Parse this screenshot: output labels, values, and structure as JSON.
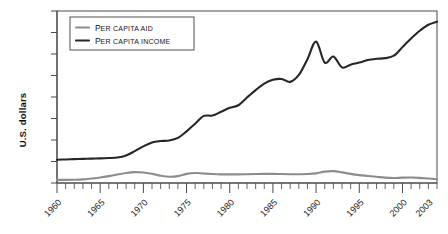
{
  "chart_data": {
    "type": "line",
    "title": "",
    "xlabel": "",
    "ylabel": "U.S. dollars",
    "grid": false,
    "legend_position": "top-left",
    "x_axis": {
      "start": 1960,
      "end": 2004,
      "minor_tick_interval": 1,
      "major_tick_interval": 5,
      "tick_labels": [
        "1960",
        "1965",
        "1970",
        "1975",
        "1980",
        "1985",
        "1990",
        "1995",
        "2000",
        "2003"
      ],
      "tick_label_years": [
        1960,
        1965,
        1970,
        1975,
        1980,
        1985,
        1990,
        1995,
        2000,
        2003
      ],
      "tick_label_rotation_degrees": -45
    },
    "y_axis": {
      "labels_shown": false,
      "tick_count": 8,
      "ylim_relative": [
        0,
        1
      ]
    },
    "x": [
      1960,
      1961,
      1962,
      1963,
      1964,
      1965,
      1966,
      1967,
      1968,
      1969,
      1970,
      1971,
      1972,
      1973,
      1974,
      1975,
      1976,
      1977,
      1978,
      1979,
      1980,
      1981,
      1982,
      1983,
      1984,
      1985,
      1986,
      1987,
      1988,
      1989,
      1990,
      1991,
      1992,
      1993,
      1994,
      1995,
      1996,
      1997,
      1998,
      1999,
      2000,
      2001,
      2002,
      2003,
      2004
    ],
    "series": [
      {
        "name": "Per capita income",
        "legend_lead": "P",
        "legend_rest": "ER CAPITA INCOME",
        "color": "#262626",
        "stroke_width": 2.1,
        "values": [
          0.135,
          0.137,
          0.139,
          0.14,
          0.142,
          0.143,
          0.145,
          0.148,
          0.16,
          0.185,
          0.213,
          0.236,
          0.244,
          0.247,
          0.262,
          0.3,
          0.345,
          0.39,
          0.392,
          0.414,
          0.437,
          0.452,
          0.497,
          0.54,
          0.578,
          0.6,
          0.605,
          0.588,
          0.628,
          0.72,
          0.822,
          0.7,
          0.735,
          0.672,
          0.688,
          0.7,
          0.715,
          0.722,
          0.726,
          0.74,
          0.79,
          0.84,
          0.885,
          0.92,
          0.938
        ]
      },
      {
        "name": "Per capita aid",
        "legend_lead": "P",
        "legend_rest": "ER CAPITA AID",
        "color": "#8c8c8c",
        "stroke_width": 2.1,
        "values": [
          0.018,
          0.018,
          0.019,
          0.021,
          0.026,
          0.032,
          0.04,
          0.049,
          0.058,
          0.063,
          0.061,
          0.053,
          0.042,
          0.036,
          0.04,
          0.053,
          0.058,
          0.055,
          0.052,
          0.05,
          0.05,
          0.05,
          0.051,
          0.052,
          0.053,
          0.053,
          0.052,
          0.051,
          0.051,
          0.052,
          0.056,
          0.066,
          0.069,
          0.062,
          0.053,
          0.046,
          0.041,
          0.036,
          0.031,
          0.029,
          0.031,
          0.032,
          0.03,
          0.026,
          0.022
        ]
      }
    ]
  }
}
